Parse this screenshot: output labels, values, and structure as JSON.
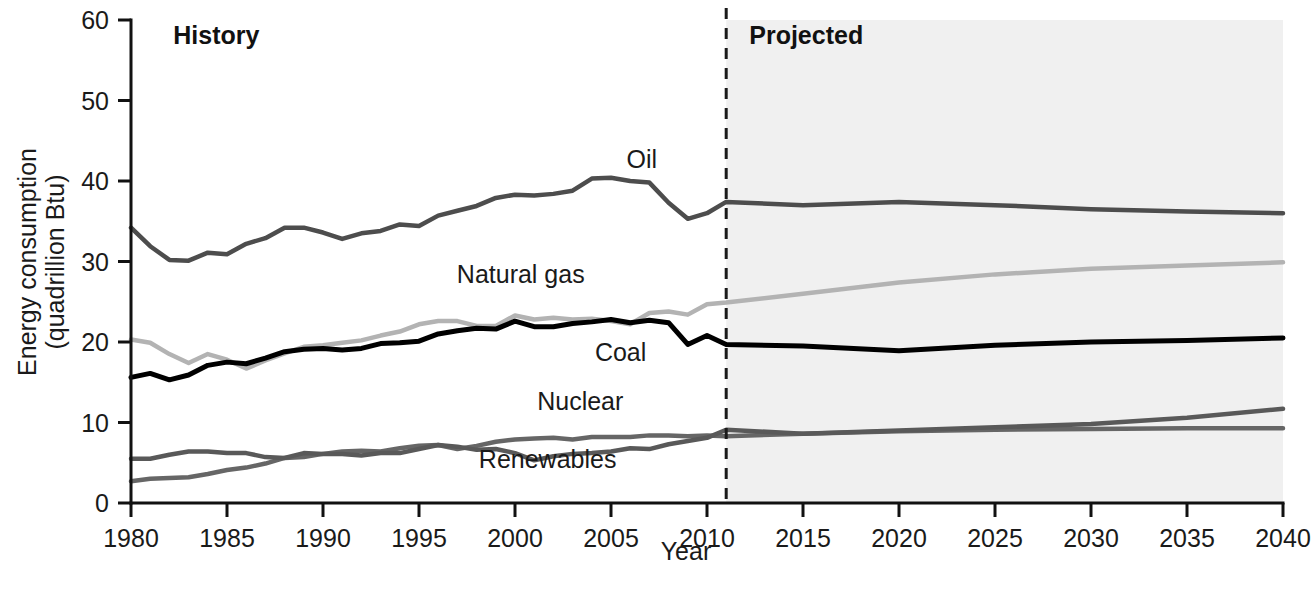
{
  "chart_data": {
    "type": "line",
    "title": "",
    "xlabel": "Year",
    "ylabel": "Energy consumption (quadrillion Btu)",
    "ylabel_line1": "Energy consumption",
    "ylabel_line2": "(quadrillion Btu)",
    "xlim": [
      1980,
      2040
    ],
    "ylim": [
      0,
      60
    ],
    "xticks": [
      1980,
      1985,
      1990,
      1995,
      2000,
      2005,
      2010,
      2015,
      2020,
      2025,
      2030,
      2035,
      2040
    ],
    "xtick_labels": [
      "1980",
      "1985",
      "1990",
      "1995",
      "2000",
      "2005",
      "2010",
      "2015",
      "2020",
      "2025",
      "2030",
      "2035",
      "2040"
    ],
    "yticks": [
      0,
      10,
      20,
      30,
      40,
      50,
      60
    ],
    "ytick_labels": [
      "0",
      "10",
      "20",
      "30",
      "40",
      "50",
      "60"
    ],
    "grid": false,
    "legend_position": "inline-labels",
    "history_projection_split_year": 2011,
    "annotations": [
      {
        "name": "history",
        "text": "History",
        "x_year": 1982.2,
        "y_value": 57.0,
        "bold": true
      },
      {
        "name": "projected",
        "text": "Projected",
        "x_year": 2012.2,
        "y_value": 57.0,
        "bold": true
      }
    ],
    "series_labels": [
      {
        "name": "oil",
        "text": "Oil",
        "x_year": 2006.6,
        "y_value": 41.6
      },
      {
        "name": "natural-gas",
        "text": "Natural gas",
        "x_year": 2000.3,
        "y_value": 27.3
      },
      {
        "name": "coal",
        "text": "Coal",
        "x_year": 2005.5,
        "y_value": 17.6
      },
      {
        "name": "nuclear",
        "text": "Nuclear",
        "x_year": 2003.4,
        "y_value": 11.5
      },
      {
        "name": "renewables",
        "text": "Renewables",
        "x_year": 2001.7,
        "y_value": 4.4
      }
    ],
    "x": [
      1980,
      1981,
      1982,
      1983,
      1984,
      1985,
      1986,
      1987,
      1988,
      1989,
      1990,
      1991,
      1992,
      1993,
      1994,
      1995,
      1996,
      1997,
      1998,
      1999,
      2000,
      2001,
      2002,
      2003,
      2004,
      2005,
      2006,
      2007,
      2008,
      2009,
      2010,
      2011,
      2015,
      2020,
      2025,
      2030,
      2035,
      2040
    ],
    "series": [
      {
        "name": "Oil",
        "color": "#4d4d4d",
        "width": 4.5,
        "values": [
          34.2,
          31.9,
          30.2,
          30.1,
          31.1,
          30.9,
          32.2,
          32.9,
          34.2,
          34.2,
          33.6,
          32.8,
          33.5,
          33.8,
          34.6,
          34.4,
          35.7,
          36.3,
          36.9,
          37.9,
          38.3,
          38.2,
          38.4,
          38.8,
          40.3,
          40.4,
          40.0,
          39.8,
          37.3,
          35.3,
          36.0,
          37.4,
          37.0,
          37.4,
          37.0,
          36.5,
          36.2,
          36.0
        ]
      },
      {
        "name": "Natural gas",
        "color": "#b3b3b3",
        "width": 4.5,
        "values": [
          20.3,
          19.9,
          18.5,
          17.4,
          18.5,
          17.8,
          16.7,
          17.7,
          18.6,
          19.4,
          19.6,
          19.9,
          20.2,
          20.8,
          21.3,
          22.2,
          22.6,
          22.6,
          22.0,
          22.0,
          23.3,
          22.8,
          23.0,
          22.8,
          22.9,
          22.6,
          22.2,
          23.6,
          23.8,
          23.4,
          24.7,
          24.9,
          26.0,
          27.4,
          28.4,
          29.1,
          29.5,
          29.9
        ]
      },
      {
        "name": "Coal",
        "color": "#000000",
        "width": 5.0,
        "values": [
          15.6,
          16.1,
          15.3,
          15.9,
          17.1,
          17.5,
          17.3,
          18.0,
          18.8,
          19.1,
          19.2,
          19.0,
          19.2,
          19.8,
          19.9,
          20.1,
          21.0,
          21.4,
          21.7,
          21.6,
          22.6,
          21.9,
          21.9,
          22.3,
          22.5,
          22.8,
          22.4,
          22.7,
          22.4,
          19.7,
          20.8,
          19.7,
          19.5,
          18.9,
          19.6,
          20.0,
          20.2,
          20.5
        ]
      },
      {
        "name": "Nuclear",
        "color": "#666666",
        "width": 4.5,
        "values": [
          2.7,
          3.0,
          3.1,
          3.2,
          3.6,
          4.1,
          4.4,
          4.9,
          5.6,
          5.7,
          6.1,
          6.4,
          6.5,
          6.4,
          6.8,
          7.1,
          7.2,
          6.7,
          7.1,
          7.6,
          7.9,
          8.0,
          8.1,
          7.9,
          8.2,
          8.2,
          8.2,
          8.4,
          8.4,
          8.3,
          8.4,
          8.3,
          8.6,
          8.9,
          9.1,
          9.2,
          9.3,
          9.3
        ]
      },
      {
        "name": "Renewables",
        "color": "#595959",
        "width": 4.5,
        "values": [
          5.5,
          5.5,
          6.0,
          6.4,
          6.4,
          6.2,
          6.2,
          5.7,
          5.6,
          6.2,
          6.1,
          6.1,
          5.9,
          6.2,
          6.2,
          6.7,
          7.2,
          7.0,
          6.6,
          6.7,
          6.2,
          5.3,
          5.8,
          6.1,
          6.2,
          6.4,
          6.8,
          6.7,
          7.3,
          7.7,
          8.1,
          9.1,
          8.6,
          9.0,
          9.4,
          9.8,
          10.6,
          11.7
        ]
      }
    ]
  },
  "style": {
    "projection_shading_color": "#f0f0f0",
    "axis_color": "#111111",
    "text_color": "#1a1a1a",
    "background_color": "#ffffff"
  }
}
